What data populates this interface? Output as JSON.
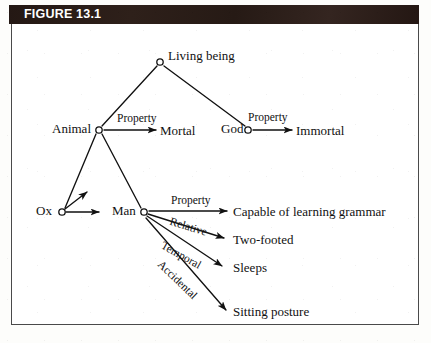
{
  "figure": {
    "label": "FIGURE 13.1"
  },
  "diagram": {
    "type": "semantic-network",
    "nodes": [
      {
        "id": "living-being",
        "label": "Living being",
        "x": 160,
        "y": 62,
        "label_x": 168,
        "label_y": 48
      },
      {
        "id": "animal",
        "label": "Animal",
        "x": 99,
        "y": 130,
        "label_x": 52,
        "label_y": 120
      },
      {
        "id": "god",
        "label": "God",
        "x": 248,
        "y": 130,
        "label_x": 221,
        "label_y": 120
      },
      {
        "id": "ox",
        "label": "Ox",
        "x": 62,
        "y": 212,
        "label_x": 35,
        "label_y": 202
      },
      {
        "id": "man",
        "label": "Man",
        "x": 144,
        "y": 212,
        "label_x": 112,
        "label_y": 202
      },
      {
        "id": "mortal",
        "label": "Mortal",
        "x": 198,
        "y": 130,
        "label_x": 160,
        "label_y": 122
      },
      {
        "id": "immortal",
        "label": "Immortal",
        "x": 299,
        "y": 130,
        "label_x": 296,
        "label_y": 122
      },
      {
        "id": "capable",
        "label": "Capable of learning grammar",
        "x": 232,
        "y": 212,
        "label_x": 232,
        "label_y": 203
      },
      {
        "id": "two-footed",
        "label": "Two-footed",
        "x": 230,
        "y": 240,
        "label_x": 232,
        "label_y": 231
      },
      {
        "id": "sleeps",
        "label": "Sleeps",
        "x": 228,
        "y": 268,
        "label_x": 232,
        "label_y": 259
      },
      {
        "id": "sitting",
        "label": "Sitting posture",
        "x": 232,
        "y": 312,
        "label_x": 232,
        "label_y": 303
      }
    ],
    "edges": [
      {
        "id": "living-to-animal",
        "from": "living-being",
        "to": "animal",
        "label": "",
        "kind": "isa"
      },
      {
        "id": "living-to-god",
        "from": "living-being",
        "to": "god",
        "label": "",
        "kind": "isa"
      },
      {
        "id": "animal-to-ox",
        "from": "animal",
        "to": "ox",
        "label": "",
        "kind": "isa"
      },
      {
        "id": "animal-to-man",
        "from": "animal",
        "to": "man",
        "label": "",
        "kind": "isa"
      },
      {
        "id": "animal-mortal",
        "from": "animal",
        "to": "mortal",
        "label": "Property",
        "kind": "property",
        "label_x": 118,
        "label_y": 112
      },
      {
        "id": "god-immortal",
        "from": "god",
        "to": "immortal",
        "label": "Property",
        "kind": "property",
        "label_x": 250,
        "label_y": 111
      },
      {
        "id": "man-capable",
        "from": "man",
        "to": "capable",
        "label": "Property",
        "kind": "property",
        "label_x": 171,
        "label_y": 194
      },
      {
        "id": "man-twofooted",
        "from": "man",
        "to": "two-footed",
        "label": "Relative",
        "kind": "property",
        "label_x": 173,
        "label_y": 214
      },
      {
        "id": "man-sleeps",
        "from": "man",
        "to": "sleeps",
        "label": "Temporal",
        "kind": "property",
        "label_x": 166,
        "label_y": 238
      },
      {
        "id": "man-sitting",
        "from": "man",
        "to": "sitting",
        "label": "Accidental",
        "kind": "property",
        "label_x": 166,
        "label_y": 262
      },
      {
        "id": "ox-extra-1",
        "from": "ox",
        "to": "",
        "label": "",
        "kind": "property"
      },
      {
        "id": "ox-extra-2",
        "from": "ox",
        "to": "",
        "label": "",
        "kind": "property"
      }
    ],
    "colors": {
      "ink": "#111111",
      "frame": "#4a4a4a",
      "title_bar": "#231713",
      "title_text": "#ffffff",
      "paper": "#ffffff"
    }
  }
}
